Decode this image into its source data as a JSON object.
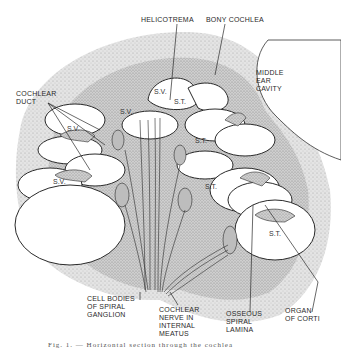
{
  "figure": {
    "title_labels": {
      "helicotrema": "HELICOTREMA",
      "bony_cochlea": "BONY COCHLEA",
      "middle_ear_cavity": [
        "MIDDLE",
        "EAR",
        "CAVITY"
      ],
      "cochlear_duct": [
        "COCHLEAR",
        "DUCT"
      ]
    },
    "bottom_labels": {
      "cell_bodies": [
        "CELL BODIES",
        "OF SPIRAL",
        "GANGLION"
      ],
      "cochlear_nerve": [
        "COCHLEAR",
        "NERVE IN",
        "INTERNAL",
        "MEATUS"
      ],
      "osseous_lamina": [
        "OSSEOUS",
        "SPIRAL",
        "LAMINA"
      ],
      "organ_of_corti": [
        "ORGAN",
        "OF CORTI"
      ]
    },
    "chamber_labels": {
      "sv": "S.V.",
      "st": "S.T."
    },
    "caption": "Fig. 1. — Horizontal section through the cochlea"
  },
  "colors": {
    "ink": "#2a2a2a",
    "stipple_bone": "#cfcfcf",
    "stipple_dark": "#b5b5b5",
    "chamber_fill": "#ffffff"
  }
}
